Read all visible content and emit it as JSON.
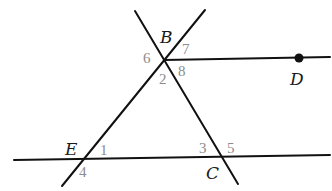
{
  "diagram": {
    "type": "geometry",
    "colors": {
      "line": "#111111",
      "point_label": "#1a1a1a",
      "angle_label": "#8c8c8c"
    },
    "points": {
      "B": {
        "label": "B",
        "x": 164,
        "y": 60
      },
      "D": {
        "label": "D",
        "x": 299,
        "y": 58
      },
      "E": {
        "label": "E",
        "x": 86,
        "y": 159
      },
      "C": {
        "label": "C",
        "x": 224,
        "y": 157
      }
    },
    "lines": [
      {
        "name": "line-EB",
        "x1": 62,
        "y1": 186,
        "x2": 205,
        "y2": 10
      },
      {
        "name": "line-BC",
        "x1": 135,
        "y1": 11,
        "x2": 238,
        "y2": 184
      },
      {
        "name": "ray-BD",
        "x1": 164,
        "y1": 60,
        "x2": 330,
        "y2": 57
      },
      {
        "name": "line-EC",
        "x1": 14,
        "y1": 160,
        "x2": 330,
        "y2": 155
      }
    ],
    "angles": {
      "a1": "1",
      "a2": "2",
      "a3": "3",
      "a4": "4",
      "a5": "5",
      "a6": "6",
      "a7": "7",
      "a8": "8"
    }
  }
}
